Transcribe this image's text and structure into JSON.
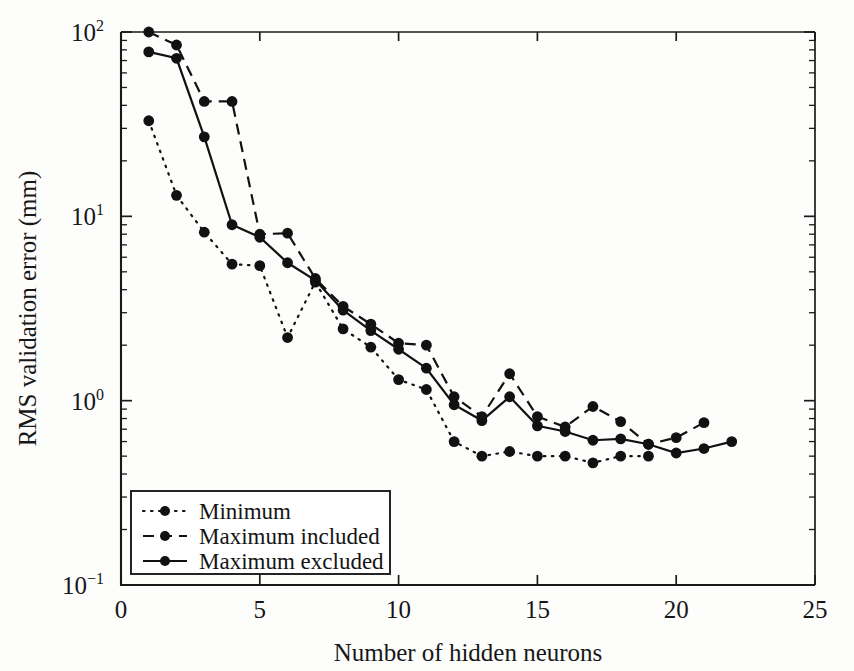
{
  "chart_data": {
    "type": "line",
    "title": "",
    "xlabel": "Number of hidden neurons",
    "ylabel": "RMS validation error (mm)",
    "xlim": [
      0,
      25
    ],
    "ylim": [
      0.1,
      100
    ],
    "yscale": "log",
    "xticks": [
      0,
      5,
      10,
      15,
      20,
      25
    ],
    "xtick_labels": [
      "0",
      "5",
      "10",
      "15",
      "20",
      "25"
    ],
    "yticks": [
      0.1,
      1,
      10,
      100
    ],
    "ytick_labels": [
      "10⁻¹",
      "10⁰",
      "10¹",
      "10²"
    ],
    "grid": false,
    "legend_position": "lower left",
    "series": [
      {
        "name": "Minimum",
        "style": "dotted",
        "marker": "circle",
        "x": [
          1,
          2,
          3,
          4,
          5,
          6,
          7,
          8,
          9,
          10,
          11,
          12,
          13,
          14,
          15,
          16,
          17,
          18,
          19
        ],
        "values": [
          33,
          13,
          8.2,
          5.5,
          5.4,
          2.2,
          4.4,
          2.45,
          1.95,
          1.3,
          1.15,
          0.6,
          0.5,
          0.53,
          0.5,
          0.5,
          0.46,
          0.5,
          0.5
        ]
      },
      {
        "name": "Maximum included",
        "style": "dashed",
        "marker": "circle",
        "x": [
          1,
          2,
          3,
          4,
          5,
          6,
          7,
          8,
          9,
          10,
          11,
          12,
          13,
          14,
          15,
          16,
          17,
          18,
          19,
          20,
          21
        ],
        "values": [
          100,
          85,
          42,
          42,
          8.0,
          8.1,
          4.6,
          3.25,
          2.6,
          2.05,
          2.0,
          1.05,
          0.82,
          1.4,
          0.82,
          0.72,
          0.93,
          0.77,
          0.58,
          0.63,
          0.76
        ]
      },
      {
        "name": "Maximum excluded",
        "style": "solid",
        "marker": "circle",
        "x": [
          1,
          2,
          3,
          4,
          5,
          6,
          7,
          8,
          9,
          10,
          11,
          12,
          13,
          14,
          15,
          16,
          17,
          18,
          19,
          20,
          21,
          22
        ],
        "values": [
          78,
          72,
          27,
          9.0,
          7.7,
          5.6,
          4.5,
          3.1,
          2.4,
          1.9,
          1.5,
          0.95,
          0.78,
          1.05,
          0.73,
          0.68,
          0.61,
          0.62,
          0.58,
          0.52,
          0.55,
          0.6
        ]
      }
    ]
  },
  "legend": {
    "entries": [
      {
        "label": "Minimum",
        "style": "dotted"
      },
      {
        "label": "Maximum included",
        "style": "dashed"
      },
      {
        "label": "Maximum excluded",
        "style": "solid"
      }
    ]
  }
}
